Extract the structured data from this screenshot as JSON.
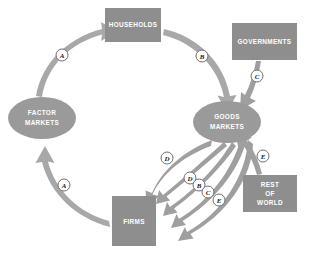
{
  "diagram": {
    "canvas": {
      "width": 310,
      "height": 255
    },
    "colors": {
      "box_fill": "#8e8e8e",
      "ellipse_fill": "#9a9a9a",
      "ring_arrow": "#a8a8a8",
      "inner_arrow": "#9f9f9f",
      "badge_fill": "#ffffff",
      "badge_stroke": "#6f6f6f",
      "label_text": "#ffffff",
      "background": "#ffffff"
    }
  },
  "nodes": [
    {
      "id": "households",
      "shape": "rect",
      "lines": [
        "HOUSEHOLDS"
      ],
      "x": 105,
      "y": 8,
      "w": 56,
      "h": 34
    },
    {
      "id": "governments",
      "shape": "rect",
      "lines": [
        "GOVERNMENTS"
      ],
      "x": 232,
      "y": 23,
      "w": 65,
      "h": 37
    },
    {
      "id": "factor-markets",
      "shape": "ellipse",
      "lines": [
        "FACTOR",
        "MARKETS"
      ],
      "cx": 42,
      "cy": 118,
      "rx": 34,
      "ry": 21
    },
    {
      "id": "goods-markets",
      "shape": "ellipse",
      "lines": [
        "GOODS",
        "MARKETS"
      ],
      "cx": 227,
      "cy": 122,
      "rx": 34,
      "ry": 21
    },
    {
      "id": "rest-of-world",
      "shape": "rect",
      "lines": [
        "REST",
        "OF",
        "WORLD"
      ],
      "x": 243,
      "y": 175,
      "w": 54,
      "h": 37
    },
    {
      "id": "firms",
      "shape": "rect",
      "lines": [
        "FIRMS"
      ],
      "x": 112,
      "y": 196,
      "w": 44,
      "h": 50
    }
  ],
  "badges": [
    {
      "id": "badge-a-top",
      "label": "A",
      "cx": 62,
      "cy": 55
    },
    {
      "id": "badge-b-top",
      "label": "B",
      "cx": 202,
      "cy": 56
    },
    {
      "id": "badge-c-gov",
      "label": "C",
      "cx": 257,
      "cy": 76
    },
    {
      "id": "badge-a-bottom",
      "label": "A",
      "cx": 64,
      "cy": 185
    },
    {
      "id": "badge-d-upper",
      "label": "D",
      "cx": 167,
      "cy": 158
    },
    {
      "id": "badge-d-lower",
      "label": "D",
      "cx": 190,
      "cy": 178
    },
    {
      "id": "badge-b-lower",
      "label": "B",
      "cx": 199,
      "cy": 185
    },
    {
      "id": "badge-c-lower",
      "label": "C",
      "cx": 208,
      "cy": 192
    },
    {
      "id": "badge-e-lower",
      "label": "E",
      "cx": 219,
      "cy": 200
    },
    {
      "id": "badge-e-row",
      "label": "E",
      "cx": 263,
      "cy": 156
    }
  ],
  "flows": [
    {
      "id": "flow-factor-to-households",
      "from": "factor-markets",
      "to": "households",
      "label": "A"
    },
    {
      "id": "flow-households-to-goods",
      "from": "households",
      "to": "goods-markets",
      "label": "B"
    },
    {
      "id": "flow-firms-to-factor",
      "from": "firms",
      "to": "factor-markets",
      "label": "A"
    },
    {
      "id": "flow-goods-to-firms-d1",
      "from": "goods-markets",
      "to": "firms",
      "label": "D"
    },
    {
      "id": "flow-goods-to-firms-d2",
      "from": "goods-markets",
      "to": "firms",
      "label": "D"
    },
    {
      "id": "flow-goods-to-firms-b",
      "from": "goods-markets",
      "to": "firms",
      "label": "B"
    },
    {
      "id": "flow-goods-to-firms-c",
      "from": "goods-markets",
      "to": "firms",
      "label": "C"
    },
    {
      "id": "flow-goods-to-firms-e",
      "from": "goods-markets",
      "to": "firms",
      "label": "E"
    },
    {
      "id": "flow-governments-to-goods",
      "from": "governments",
      "to": "goods-markets",
      "label": "C"
    },
    {
      "id": "flow-rest-of-world-to-goods",
      "from": "rest-of-world",
      "to": "goods-markets",
      "label": "E"
    }
  ]
}
